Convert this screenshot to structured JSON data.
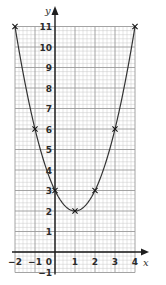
{
  "chart_data": {
    "type": "line",
    "title": "",
    "xlabel": "x",
    "ylabel": "y",
    "xlim": [
      -2,
      4
    ],
    "ylim": [
      -1,
      11
    ],
    "grid": true,
    "x_ticks": [
      "-2",
      "-1",
      "0",
      "1",
      "2",
      "3",
      "4"
    ],
    "y_ticks": [
      "-1",
      "1",
      "2",
      "3",
      "4",
      "5",
      "6",
      "7",
      "8",
      "9",
      "10",
      "11"
    ],
    "series": [
      {
        "name": "curve",
        "x": [
          -2,
          -1,
          0,
          1,
          2,
          3,
          4
        ],
        "values": [
          11,
          6,
          3,
          2,
          3,
          6,
          11
        ],
        "marker": "x"
      }
    ]
  },
  "colors": {
    "grid_minor": "#c8c8c8",
    "grid_major": "#9a9a9a",
    "axis": "#1e1e1e",
    "curve": "#333333"
  }
}
